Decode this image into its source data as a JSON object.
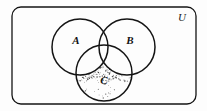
{
  "figure": {
    "kind": "venn-diagram",
    "background_color": "#fdfdfd",
    "ink_color": "#141414"
  },
  "universe": {
    "label": "U",
    "label_x": 182,
    "label_y": 21,
    "font_size": 11,
    "rect": {
      "x": 12,
      "y": 7,
      "width": 184,
      "height": 97,
      "radius": 9,
      "stroke_width": 1.3
    }
  },
  "sets": [
    {
      "name": "set-a",
      "label": "A",
      "cx": 80,
      "cy": 47,
      "r": 28,
      "label_x": 76,
      "label_y": 44,
      "font_size": 11
    },
    {
      "name": "set-b",
      "label": "B",
      "cx": 127,
      "cy": 47,
      "r": 28,
      "label_x": 130,
      "label_y": 44,
      "font_size": 11
    },
    {
      "name": "set-c",
      "label": "C",
      "cx": 104,
      "cy": 73,
      "r": 28,
      "label_x": 104,
      "label_y": 84,
      "font_size": 11
    }
  ],
  "shading": {
    "region_name": "c-only-and-partial-intersections",
    "style": "stipple",
    "dot_color": "#2a2a2a",
    "dot_count": 150
  }
}
